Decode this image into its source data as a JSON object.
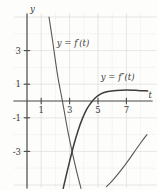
{
  "chart_data": {
    "type": "line",
    "title": "",
    "xlabel": "t",
    "ylabel": "y",
    "xlim": [
      -0.5,
      8.6
    ],
    "ylim": [
      -5.2,
      5.0
    ],
    "grid": true,
    "grid_spacing": 1,
    "legend": "inline-labels",
    "x_ticks": [
      1,
      3,
      5,
      7
    ],
    "x_tick_labels": [
      "1",
      "3",
      "5",
      "7"
    ],
    "y_ticks": [
      3,
      1,
      -1,
      -3
    ],
    "y_tick_labels": [
      "3",
      "1",
      "-1",
      "-3"
    ],
    "annotations": [
      {
        "text": "y = f′(t)",
        "x": 2.1,
        "y": 3.3
      },
      {
        "text": "y = f″(t)",
        "x": 5.2,
        "y": 1.25
      }
    ],
    "series": [
      {
        "name": "y = f'(t)",
        "label": "y = f′(t)",
        "style": "thin",
        "color": "#575757",
        "points": [
          [
            1.55,
            5.0
          ],
          [
            1.8,
            3.6
          ],
          [
            2.0,
            2.4
          ],
          [
            2.2,
            1.3
          ],
          [
            2.45,
            0.2
          ],
          [
            2.6,
            -0.5
          ],
          [
            2.9,
            -1.9
          ],
          [
            3.2,
            -3.1
          ],
          [
            3.5,
            -4.2
          ],
          [
            3.8,
            -5.2
          ]
        ]
      },
      {
        "name": "y = f'(t) continuation",
        "label": "",
        "style": "thin",
        "color": "#575757",
        "points": [
          [
            5.6,
            -5.1
          ],
          [
            6.0,
            -4.75
          ],
          [
            6.5,
            -4.25
          ],
          [
            7.0,
            -3.7
          ],
          [
            7.5,
            -3.1
          ],
          [
            8.0,
            -2.5
          ],
          [
            8.45,
            -2.0
          ]
        ]
      },
      {
        "name": "y = f''(t)",
        "label": "y = f″(t)",
        "style": "thick",
        "color": "#3d3d3d",
        "points": [
          [
            2.55,
            -5.2
          ],
          [
            2.8,
            -4.3
          ],
          [
            3.0,
            -3.6
          ],
          [
            3.3,
            -2.6
          ],
          [
            3.6,
            -1.75
          ],
          [
            3.9,
            -1.05
          ],
          [
            4.2,
            -0.5
          ],
          [
            4.5,
            -0.12
          ],
          [
            4.8,
            0.18
          ],
          [
            5.2,
            0.42
          ],
          [
            5.7,
            0.56
          ],
          [
            6.3,
            0.63
          ],
          [
            7.0,
            0.65
          ],
          [
            7.8,
            0.63
          ],
          [
            8.5,
            0.6
          ]
        ]
      }
    ]
  },
  "axes": {
    "y_axis_label": "y",
    "x_axis_label": "t"
  }
}
